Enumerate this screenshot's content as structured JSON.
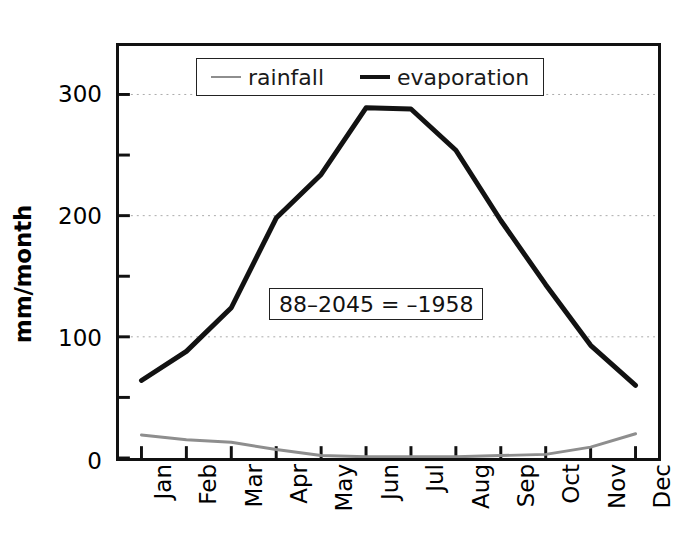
{
  "chart_data": {
    "type": "line",
    "title": "",
    "xlabel": "",
    "ylabel": "mm/month",
    "categories": [
      "Jan",
      "Feb",
      "Mar",
      "Apr",
      "May",
      "Jun",
      "Jul",
      "Aug",
      "Sep",
      "Oct",
      "Nov",
      "Dec"
    ],
    "series": [
      {
        "name": "rainfall",
        "color": "#8e8e8e",
        "values": [
          19,
          15,
          13,
          7,
          2,
          1,
          1,
          1,
          2,
          3,
          9,
          20
        ]
      },
      {
        "name": "evaporation",
        "color": "#121212",
        "values": [
          64,
          88,
          124,
          198,
          234,
          289,
          288,
          254,
          196,
          143,
          93,
          60
        ]
      }
    ],
    "ylim": [
      0,
      340
    ],
    "yticks": [
      0,
      100,
      200,
      300
    ],
    "yticklabels": [
      "0",
      "100",
      "200",
      "300"
    ],
    "yminorticks": [
      50,
      150,
      250
    ],
    "grid": true,
    "grid_axis": "y",
    "legend": {
      "position": "upper-center",
      "entries": [
        {
          "label": "rainfall",
          "marker": "line",
          "color": "#8e8e8e"
        },
        {
          "label": "evaporation",
          "marker": "line",
          "color": "#121212"
        }
      ]
    },
    "annotations": [
      {
        "text": "88–2045 = –1958",
        "boxed": true,
        "x_category": "May",
        "y_value": 128
      }
    ]
  },
  "legend": {
    "rainfall_label": "rainfall",
    "evaporation_label": "evaporation"
  },
  "axes": {
    "ylabel": "mm/month",
    "ytick_0": "0",
    "ytick_1": "100",
    "ytick_2": "200",
    "ytick_3": "300"
  },
  "annotation": {
    "text": "88–2045 = –1958"
  }
}
